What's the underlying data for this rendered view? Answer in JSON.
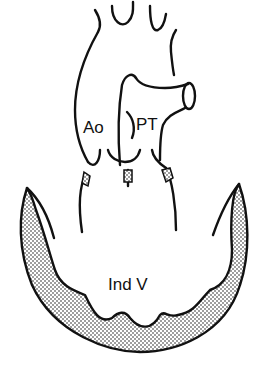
{
  "diagram": {
    "type": "anatomical-line-drawing",
    "labels": {
      "aorta": "Ao",
      "pulmonary_trunk": "PT",
      "ventricle": "Ind V"
    },
    "colors": {
      "line": "#111111",
      "background": "#ffffff",
      "stipple": "#222222"
    }
  }
}
